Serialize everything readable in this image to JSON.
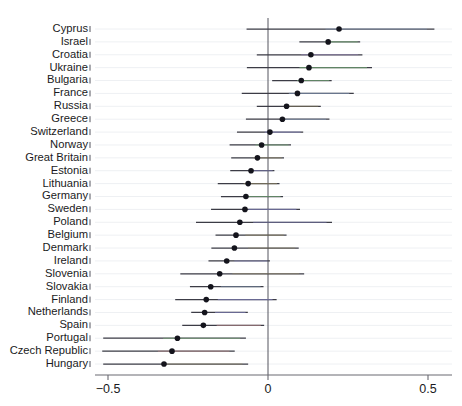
{
  "chart_data": {
    "type": "scatter",
    "subtype": "forest-plot",
    "title": "",
    "subtitle": "",
    "xlabel": "",
    "ylabel": "",
    "xlim": [
      -0.58,
      0.55
    ],
    "xticks": [
      -0.5,
      0,
      0.5
    ],
    "xticklabels": [
      "−0.5",
      "0",
      "0.5"
    ],
    "grid": true,
    "grid_axis": "y",
    "legend": "none",
    "reference_line": 0,
    "orientation": "horizontal",
    "marker": "filled-circle",
    "categories": [
      "Cyprus",
      "Israel",
      "Croatia",
      "Ukraine",
      "Bulgaria",
      "France",
      "Russia",
      "Greece",
      "Switzerland",
      "Norway",
      "Great Britain",
      "Estonia",
      "Lithuania",
      "Germany",
      "Sweden",
      "Poland",
      "Belgium",
      "Denmark",
      "Ireland",
      "Slovenia",
      "Slovakia",
      "Finland",
      "Netherlands",
      "Spain",
      "Portugal",
      "Czech Republic",
      "Hungary"
    ],
    "series": [
      {
        "name": "estimate",
        "values": [
          0.222,
          0.188,
          0.134,
          0.128,
          0.104,
          0.092,
          0.058,
          0.045,
          0.006,
          -0.02,
          -0.033,
          -0.053,
          -0.062,
          -0.069,
          -0.072,
          -0.088,
          -0.1,
          -0.105,
          -0.129,
          -0.151,
          -0.179,
          -0.193,
          -0.198,
          -0.202,
          -0.283,
          -0.3,
          -0.325
        ]
      },
      {
        "name": "ci_low",
        "values": [
          -0.067,
          0.098,
          -0.035,
          -0.066,
          0.013,
          -0.082,
          -0.035,
          -0.069,
          -0.097,
          -0.12,
          -0.115,
          -0.118,
          -0.157,
          -0.147,
          -0.178,
          -0.225,
          -0.164,
          -0.177,
          -0.186,
          -0.274,
          -0.244,
          -0.29,
          -0.24,
          -0.268,
          -0.515,
          -0.518,
          -0.515
        ]
      },
      {
        "name": "ci_high",
        "values": [
          0.52,
          0.288,
          0.295,
          0.325,
          0.199,
          0.268,
          0.165,
          0.192,
          0.11,
          0.072,
          0.05,
          0.02,
          0.036,
          0.047,
          0.1,
          0.2,
          0.058,
          0.096,
          0.006,
          0.113,
          -0.014,
          0.027,
          -0.063,
          -0.012,
          -0.069,
          -0.104,
          -0.062
        ]
      }
    ],
    "tint_colors": [
      "#8fa7c8",
      "#7fbf7f",
      "#9a86c0",
      "#7fbf7f",
      "#7fbf7f",
      "#8fa7c8",
      "#9a8f6a",
      "#8fa7c8",
      "#8f8fd0",
      "#7fbf7f",
      "#9a8f6a",
      "#8f8fd0",
      "#9a8f6a",
      "#7fbf7f",
      "#8f8fd0",
      "#8f8fd0",
      "#9a8f6a",
      "#9a8f6a",
      "#8f8fd0",
      "#9a8f6a",
      "#8fa7c8",
      "#8f8fd0",
      "#8f8fd0",
      "#c08f8f",
      "#7fbf7f",
      "#c08f8f",
      "#9a8f6a"
    ],
    "colors": {
      "point": "#14141c",
      "ci": "#3c3c46",
      "grid": "#eef0f3",
      "axis": "#6a6a72",
      "reference": "#55555f",
      "background": "#ffffff"
    }
  },
  "axis": {
    "x_tick_minus_half": "−0.5",
    "x_tick_zero": "0",
    "x_tick_half": "0.5"
  }
}
